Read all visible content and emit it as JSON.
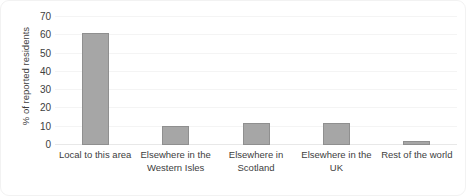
{
  "chart_data": {
    "type": "bar",
    "title": "",
    "xlabel": "",
    "ylabel": "% of reported residents",
    "categories": [
      "Local to this area",
      "Elsewhere in the Western Isles",
      "Elsewhere in Scotland",
      "Elsewhere in the UK",
      "Rest of the world"
    ],
    "values": [
      61.5,
      10.5,
      12,
      12,
      2
    ],
    "ylim": [
      0,
      70
    ],
    "yticks": [
      0,
      10,
      20,
      30,
      40,
      50,
      60,
      70
    ],
    "ytick_labels": [
      "0",
      "10",
      "20",
      "30",
      "40",
      "50",
      "60",
      "70"
    ],
    "grid": true,
    "legend": "none",
    "bar_color": "#a6a6a6",
    "bar_border_color": "#8f8f8f",
    "gridline_color": "#f4f4f4",
    "axis_text_color": "#404040",
    "background_color": "#ffffff",
    "frame_color": "#f2f2f2"
  }
}
